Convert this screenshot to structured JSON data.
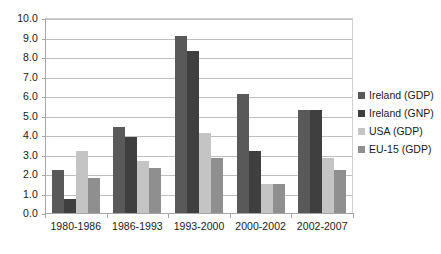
{
  "chart_data": {
    "type": "bar",
    "title": "",
    "subtitle": "",
    "xlabel": "",
    "ylabel": "",
    "ylim": [
      0.0,
      10.0
    ],
    "y_ticks": [
      "0.0",
      "1.0",
      "2.0",
      "3.0",
      "4.0",
      "5.0",
      "6.0",
      "7.0",
      "8.0",
      "9.0",
      "10.0"
    ],
    "y_tick_values": [
      0.0,
      1.0,
      2.0,
      3.0,
      4.0,
      5.0,
      6.0,
      7.0,
      8.0,
      9.0,
      10.0
    ],
    "grid": true,
    "grid_axis": "y",
    "legend_position": "right",
    "categories": [
      "1980-1986",
      "1986-1993",
      "1993-2000",
      "2000-2002",
      "2002-2007"
    ],
    "series": [
      {
        "name": "Ireland (GDP)",
        "color": "#595959",
        "values": [
          2.2,
          4.4,
          9.1,
          6.1,
          5.3
        ]
      },
      {
        "name": "Ireland (GNP)",
        "color": "#3f3f3f",
        "values": [
          0.7,
          3.9,
          8.3,
          3.2,
          5.3
        ]
      },
      {
        "name": "USA (GDP)",
        "color": "#c4c4c4",
        "values": [
          3.2,
          2.65,
          4.1,
          1.5,
          2.8
        ]
      },
      {
        "name": "EU-15 (GDP)",
        "color": "#8f8f8f",
        "values": [
          1.8,
          2.3,
          2.8,
          1.5,
          2.2
        ]
      }
    ]
  },
  "legend": {
    "items": [
      {
        "label": "Ireland (GDP)",
        "swatch": "#595959"
      },
      {
        "label": "Ireland (GNP)",
        "swatch": "#3f3f3f"
      },
      {
        "label": "USA (GDP)",
        "swatch": "#c4c4c4"
      },
      {
        "label": "EU-15 (GDP)",
        "swatch": "#8f8f8f"
      }
    ]
  }
}
